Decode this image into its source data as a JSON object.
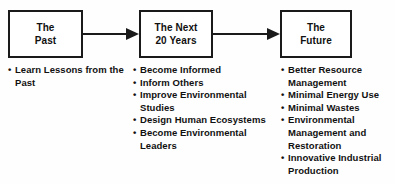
{
  "diagram": {
    "type": "flow-diagram",
    "title": "",
    "bullet_glyph": "•",
    "colors": {
      "background": "#fefefe",
      "box_border": "#1a1a1a",
      "box_fill": "#ffffff",
      "text": "#111111",
      "arrow": "#1a1a1a"
    },
    "nodes": [
      {
        "id": "past",
        "label": "The\nPast",
        "bullets": [
          "Learn Lessons from the Past"
        ]
      },
      {
        "id": "next",
        "label": "The Next\n20 Years",
        "bullets": [
          "Become Informed",
          "Inform Others",
          "Improve Environmental Studies",
          "Design Human Ecosystems",
          "Become Environmental Leaders"
        ]
      },
      {
        "id": "future",
        "label": "The\nFuture",
        "bullets": [
          "Better Resource Management",
          "Minimal Energy Use",
          "Minimal Wastes",
          "Environmental Management and Restoration",
          "Innovative Industrial Production"
        ]
      }
    ],
    "arrows": [
      {
        "id": "past-to-next",
        "from": "past",
        "to": "next",
        "style": "solid-line-with-filled-triangle-head"
      },
      {
        "id": "next-to-future",
        "from": "next",
        "to": "future",
        "style": "solid-line-with-filled-triangle-head"
      }
    ]
  }
}
